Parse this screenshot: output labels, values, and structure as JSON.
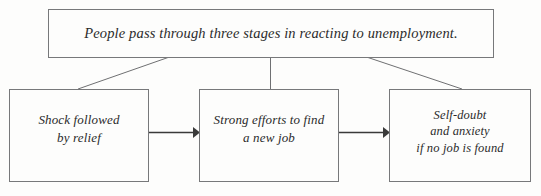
{
  "diagram": {
    "type": "flowchart",
    "orientation": "top-down-then-left-to-right",
    "statement": {
      "text": "People pass through three stages in reacting to unemployment."
    },
    "stages": [
      {
        "label": "Shock followed\nby relief"
      },
      {
        "label": "Strong efforts to find\na new job"
      },
      {
        "label": "Self-doubt\nand anxiety\nif no job is found"
      }
    ],
    "connectors": [
      {
        "name": "branch-left",
        "kind": "diagonal-line",
        "from": "statement-box",
        "to": "stage-box-1"
      },
      {
        "name": "branch-middle",
        "kind": "vertical-line",
        "from": "statement-box",
        "to": "stage-box-2"
      },
      {
        "name": "branch-right",
        "kind": "diagonal-line",
        "from": "statement-box",
        "to": "stage-box-3"
      },
      {
        "name": "arrow-stage1-to-stage2",
        "kind": "arrow",
        "from": "stage-box-1",
        "to": "stage-box-2"
      },
      {
        "name": "arrow-stage2-to-stage3",
        "kind": "arrow",
        "from": "stage-box-2",
        "to": "stage-box-3"
      }
    ],
    "colors": {
      "background": "#fdfdfc",
      "box_border": "#77787a",
      "text": "#2b2b2b",
      "connector": "#6f7072",
      "arrow": "#3a3a3a"
    }
  }
}
